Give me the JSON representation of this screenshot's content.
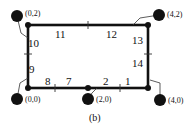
{
  "caption": "(b)",
  "nodes": [
    {
      "label": "(0,2)"
    },
    {
      "label": "(4,2)"
    },
    {
      "label": "(0,0)"
    },
    {
      "label": "(2,0)"
    },
    {
      "label": "(4,0)"
    }
  ],
  "edges": {
    "top": [
      "11",
      "12"
    ],
    "right": [
      "13",
      "14"
    ],
    "left": [
      "10",
      "9"
    ],
    "bottom": [
      "8",
      "7",
      "2",
      "1"
    ]
  }
}
